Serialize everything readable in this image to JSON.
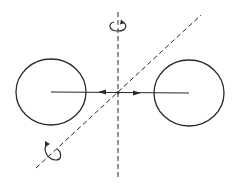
{
  "diagram": {
    "title": "Two spheres with connecting axis and rotation axes",
    "stroke_color": "#2a2a2a",
    "background": "#ffffff",
    "elements": {
      "left_circle": {
        "cx": 51,
        "cy": 92,
        "rx": 35,
        "ry": 33
      },
      "right_circle": {
        "cx": 189,
        "cy": 93,
        "rx": 35,
        "ry": 33
      },
      "connecting_line": {
        "x1": 51,
        "y1": 92,
        "x2": 189,
        "y2": 93
      },
      "vertical_axis": {
        "x1": 118,
        "y1": 12,
        "x2": 118,
        "y2": 178,
        "style": "dashed"
      },
      "diagonal_axis": {
        "x1": 36,
        "y1": 168,
        "x2": 201,
        "y2": 15,
        "style": "dashed"
      },
      "arrow_left": {
        "x": 102,
        "y": 92,
        "direction": "left"
      },
      "arrow_right": {
        "x": 137,
        "y": 93,
        "direction": "right"
      },
      "rotation_symbol_top": {
        "cx": 118,
        "cy": 27
      },
      "rotation_symbol_diagonal": {
        "cx": 52,
        "cy": 153
      }
    },
    "labels": []
  }
}
